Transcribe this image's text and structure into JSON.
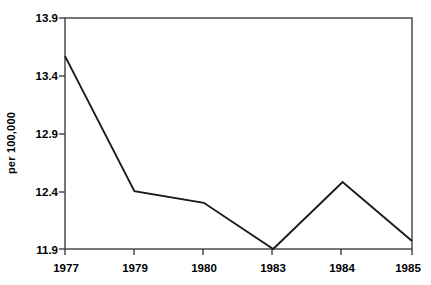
{
  "chart_data": {
    "type": "line",
    "title": "",
    "subtitle": "",
    "xlabel": "",
    "ylabel": "per 100,000",
    "categories": [
      "1977",
      "1979",
      "1980",
      "1983",
      "1984",
      "1985"
    ],
    "x": [
      1977,
      1979,
      1980,
      1983,
      1984,
      1985
    ],
    "values": [
      13.57,
      12.4,
      12.3,
      11.9,
      12.48,
      11.97
    ],
    "series": [
      {
        "name": "rate",
        "values": [
          13.57,
          12.4,
          12.3,
          11.9,
          12.48,
          11.97
        ]
      }
    ],
    "ylim": [
      11.9,
      13.9
    ],
    "yticks": [
      "13.9",
      "13.4",
      "12.9",
      "12.4",
      "11.9"
    ],
    "ytick_values": [
      13.9,
      13.4,
      12.9,
      12.4,
      11.9
    ],
    "xticks": [
      "1977",
      "1979",
      "1980",
      "1983",
      "1984",
      "1985"
    ],
    "grid": false,
    "legend": false,
    "legend_position": "none",
    "annotations": [],
    "colors": {
      "line": "#1a1a1a",
      "axis": "#3f3f3f",
      "background": "#ffffff",
      "text": "#000000"
    }
  },
  "axes": {
    "y_title": "per 100,000",
    "y_tick_labels": [
      "13.9",
      "13.4",
      "12.9",
      "12.4",
      "11.9"
    ],
    "x_tick_labels": [
      "1977",
      "1979",
      "1980",
      "1983",
      "1984",
      "1985"
    ]
  }
}
